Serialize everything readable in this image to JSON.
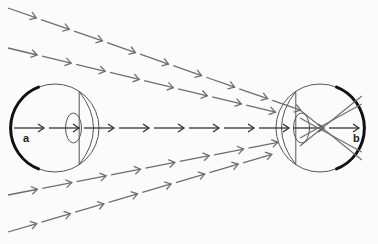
{
  "diagram": {
    "labels": {
      "a": "a",
      "b": "b"
    },
    "colors": {
      "ray": "#6e6e6e",
      "axis_ray": "#333333",
      "eye_outline": "#555555",
      "retina": "#111111"
    },
    "eyes": [
      {
        "id": "a",
        "cx": 55,
        "cy": 128,
        "r": 44,
        "retina_side": "left"
      },
      {
        "id": "b",
        "cx": 320,
        "cy": 128,
        "r": 44,
        "retina_side": "right"
      }
    ],
    "rays": [
      {
        "from": [
          8,
          8
        ],
        "to": [
          300,
          110
        ]
      },
      {
        "from": [
          8,
          48
        ],
        "to": [
          300,
          118
        ]
      },
      {
        "from": [
          14,
          128
        ],
        "to": [
          365,
          128
        ]
      },
      {
        "from": [
          8,
          195
        ],
        "to": [
          300,
          138
        ]
      },
      {
        "from": [
          8,
          232
        ],
        "to": [
          300,
          146
        ]
      }
    ]
  }
}
